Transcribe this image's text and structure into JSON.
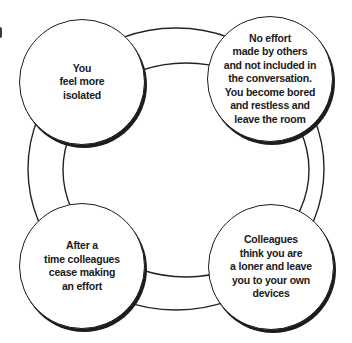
{
  "diagram": {
    "type": "cycle",
    "colors": {
      "background": "#ffffff",
      "line": "#1c1c1c",
      "text": "#1a1a1a"
    },
    "nodes": [
      {
        "id": "you-feel-more-isolated",
        "position": "top-left",
        "label": "You\nfeel more\nisolated"
      },
      {
        "id": "no-effort-made-by-others",
        "position": "top-right",
        "label": "No effort\nmade by others\nand not included in\nthe conversation.\nYou become bored\nand restless and\nleave the room"
      },
      {
        "id": "colleagues-cease-effort",
        "position": "bottom-left",
        "label": "After a\ntime colleagues\ncease making\nan effort"
      },
      {
        "id": "colleagues-think-loner",
        "position": "bottom-right",
        "label": "Colleagues\nthink you are\na loner and leave\nyou to your own\ndevices"
      }
    ]
  }
}
